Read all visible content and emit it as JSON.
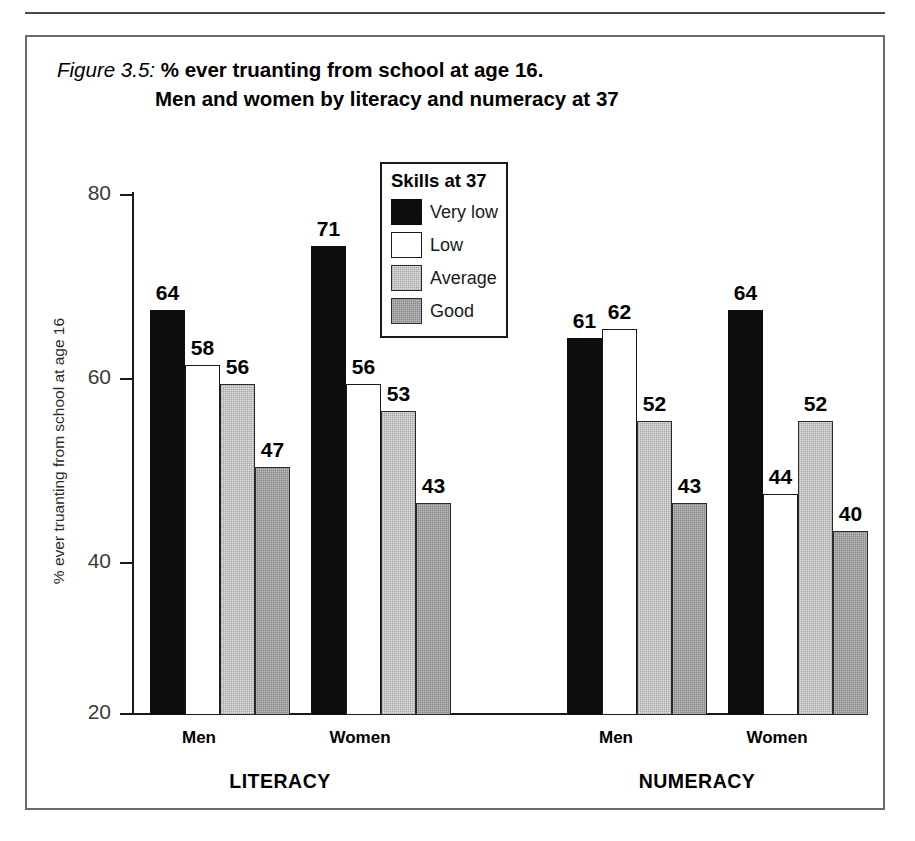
{
  "figure": {
    "label": "Figure 3.5:",
    "title_line_1": "% ever truanting from school at age 16.",
    "title_line_2": "Men and women by literacy and numeracy at 37"
  },
  "legend": {
    "title": "Skills at 37",
    "items": [
      {
        "label": "Very low",
        "color": "#0d0d0d",
        "key": "verylow"
      },
      {
        "label": "Low",
        "color": "#ffffff",
        "key": "low"
      },
      {
        "label": "Average",
        "color": "#e3e3e3",
        "key": "average"
      },
      {
        "label": "Good",
        "color": "#8a8a8a",
        "key": "good"
      }
    ]
  },
  "axes": {
    "y_title": "% ever truanting from school at age 16",
    "y_ticks": [
      "80",
      "60",
      "40",
      "20"
    ],
    "group_labels": [
      "LITERACY",
      "NUMERACY"
    ],
    "category_labels": [
      "Men",
      "Women",
      "Men",
      "Women"
    ]
  },
  "chart_data": {
    "type": "bar",
    "title": "Figure 3.5: % ever truanting from school at age 16. Men and women by literacy and numeracy at 37",
    "xlabel": "",
    "ylabel": "% ever truanting from school at age 16",
    "ylim": [
      20,
      80
    ],
    "yticks": [
      20,
      40,
      60,
      80
    ],
    "grid": false,
    "legend_title": "Skills at 37",
    "legend_position": "inside-top-center",
    "groups": [
      "LITERACY",
      "NUMERACY"
    ],
    "categories": [
      "LITERACY Men",
      "LITERACY Women",
      "NUMERACY Men",
      "NUMERACY Women"
    ],
    "series": [
      {
        "name": "Very low",
        "color": "#0d0d0d",
        "values": [
          64,
          71,
          61,
          64
        ]
      },
      {
        "name": "Low",
        "color": "#ffffff",
        "values": [
          58,
          56,
          62,
          44
        ]
      },
      {
        "name": "Average",
        "color": "#e3e3e3",
        "values": [
          56,
          53,
          52,
          52
        ]
      },
      {
        "name": "Good",
        "color": "#8a8a8a",
        "values": [
          47,
          43,
          43,
          40
        ]
      }
    ]
  },
  "bars": [
    {
      "value": "64",
      "label": "LITERACY Men Very low",
      "key": "verylow",
      "v": 64
    },
    {
      "value": "58",
      "label": "LITERACY Men Low",
      "key": "low",
      "v": 58
    },
    {
      "value": "56",
      "label": "LITERACY Men Average",
      "key": "average",
      "v": 56
    },
    {
      "value": "47",
      "label": "LITERACY Men Good",
      "key": "good",
      "v": 47
    },
    {
      "value": "71",
      "label": "LITERACY Women Very low",
      "key": "verylow",
      "v": 71
    },
    {
      "value": "56",
      "label": "LITERACY Women Low",
      "key": "low",
      "v": 56
    },
    {
      "value": "53",
      "label": "LITERACY Women Average",
      "key": "average",
      "v": 53
    },
    {
      "value": "43",
      "label": "LITERACY Women Good",
      "key": "good",
      "v": 43
    },
    {
      "value": "61",
      "label": "NUMERACY Men Very low",
      "key": "verylow",
      "v": 61
    },
    {
      "value": "62",
      "label": "NUMERACY Men Low",
      "key": "low",
      "v": 62
    },
    {
      "value": "52",
      "label": "NUMERACY Men Average",
      "key": "average",
      "v": 52
    },
    {
      "value": "43",
      "label": "NUMERACY Men Good",
      "key": "good",
      "v": 43
    },
    {
      "value": "64",
      "label": "NUMERACY Women Very low",
      "key": "verylow",
      "v": 64
    },
    {
      "value": "44",
      "label": "NUMERACY Women Low",
      "key": "low",
      "v": 44
    },
    {
      "value": "52",
      "label": "NUMERACY Women Average",
      "key": "average",
      "v": 52
    },
    {
      "value": "40",
      "label": "NUMERACY Women Good",
      "key": "good",
      "v": 40
    }
  ]
}
